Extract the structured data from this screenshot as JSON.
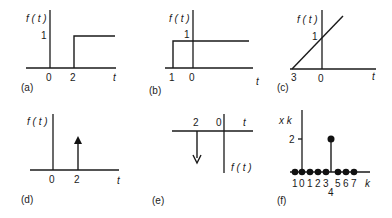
{
  "figure": {
    "panels": [
      {
        "id": "a",
        "caption": "(a)",
        "y_label": "f ( t )",
        "x_label": "t",
        "y_tick": "1",
        "x_ticks": [
          "0",
          "2"
        ],
        "description": "Unit step delayed by 2"
      },
      {
        "id": "b",
        "caption": "(b)",
        "y_label": "f ( t )",
        "x_label": "t",
        "y_tick": "1",
        "x_ticks": [
          "1",
          "0"
        ],
        "description": "Unit step starting at t = -1"
      },
      {
        "id": "c",
        "caption": "(c)",
        "y_label": "f ( t )",
        "x_label": "t",
        "y_tick": "1",
        "x_ticks": [
          "3",
          "0"
        ],
        "description": "Ramp starting at t = -3 crossing 1 at t = 0"
      },
      {
        "id": "d",
        "caption": "(d)",
        "y_label": "f ( t )",
        "x_label": "t",
        "x_ticks": [
          "0",
          "2"
        ],
        "description": "Impulse at t = 2"
      },
      {
        "id": "e",
        "caption": "(e)",
        "y_label": "f ( t )",
        "x_label": "t",
        "x_ticks": [
          "2",
          "0"
        ],
        "description": "Negative impulse at t = -2, inverted axes"
      },
      {
        "id": "f",
        "caption": "(f)",
        "y_label": "x  k",
        "x_label": "k",
        "y_tick": "2",
        "x_ticks": [
          "1",
          "0",
          "1",
          "2",
          "3",
          "4",
          "5",
          "6",
          "7"
        ],
        "description": "Discrete sequence with value 2 at k = 4, zero elsewhere"
      }
    ]
  }
}
